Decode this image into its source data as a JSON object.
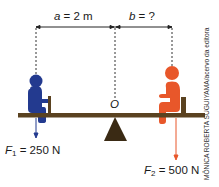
{
  "dimensions": {
    "a_label": {
      "var": "a",
      "rest": " = 2 m"
    },
    "b_label": {
      "var": "b",
      "rest": " = ?"
    }
  },
  "pivot": {
    "label": "O"
  },
  "forces": [
    {
      "symbol": "F",
      "subscript": "1",
      "rest": " = 250 N",
      "color": "#233a8f"
    },
    {
      "symbol": "F",
      "subscript": "2",
      "rest": " = 500 N",
      "color": "#e8572a"
    }
  ],
  "colors": {
    "plank": "#5a4220",
    "fulcrum": "#3a2a14",
    "dimension_line": "#222222",
    "child_left": "#233a8f",
    "child_right": "#e8572a"
  },
  "credit": "MÔNICA ROBERTA SUGUIYAMA/acervo da editora"
}
